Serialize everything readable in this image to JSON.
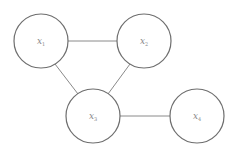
{
  "diagram": {
    "type": "undirected-graph",
    "nodes": [
      {
        "id": "n1",
        "var": "x",
        "sub": "1",
        "cx": 41,
        "cy": 41,
        "r": 27
      },
      {
        "id": "n2",
        "var": "x",
        "sub": "2",
        "cx": 144,
        "cy": 41,
        "r": 27
      },
      {
        "id": "n3",
        "var": "x",
        "sub": "3",
        "cx": 93,
        "cy": 116,
        "r": 27
      },
      {
        "id": "n4",
        "var": "x",
        "sub": "4",
        "cx": 197,
        "cy": 116,
        "r": 27
      }
    ],
    "edges": [
      {
        "from": "n1",
        "to": "n2"
      },
      {
        "from": "n1",
        "to": "n3"
      },
      {
        "from": "n2",
        "to": "n3"
      },
      {
        "from": "n3",
        "to": "n4"
      }
    ]
  }
}
